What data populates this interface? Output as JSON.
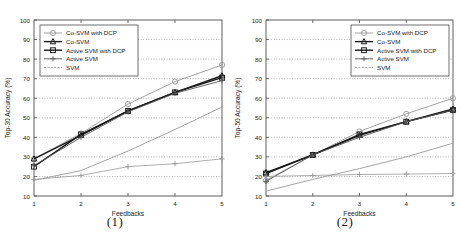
{
  "figure": {
    "panels": [
      {
        "caption": "(1)",
        "xlabel": "Feedbacks",
        "ylabel": "Top-30 Accuracy (%)"
      },
      {
        "caption": "(2)",
        "xlabel": "Feedbacks",
        "ylabel": "Top-50 Accuracy (%)"
      }
    ],
    "legend_labels": [
      "Co-SVM with DCP",
      "Co-SVM",
      "Active SVM with DCP",
      "Active SVM",
      "SVM"
    ],
    "xticks": [
      "1",
      "2",
      "3",
      "4",
      "5"
    ],
    "yticks": [
      "10",
      "20",
      "30",
      "40",
      "50",
      "60",
      "70",
      "80",
      "90",
      "100"
    ],
    "colors": {
      "dark": "#1a1a1a",
      "mid": "#555555",
      "light": "#999999",
      "grid": "#8c8c8c",
      "axis": "#4d4d4d",
      "background": "#ffffff"
    }
  },
  "chart_data": [
    {
      "type": "line",
      "title": "",
      "xlabel": "Feedbacks",
      "ylabel": "Top-30 Accuracy (%)",
      "caption": "(1)",
      "x": [
        1,
        2,
        3,
        4,
        5
      ],
      "xlim": [
        1,
        5
      ],
      "ylim": [
        10,
        100
      ],
      "grid": true,
      "legend_position": "upper-left",
      "series": [
        {
          "name": "Co-SVM with DCP",
          "marker": "circle",
          "values": [
            29,
            42,
            57,
            68.5,
            77
          ]
        },
        {
          "name": "Co-SVM",
          "marker": "triangle",
          "values": [
            29,
            41,
            53.5,
            63,
            71.5
          ]
        },
        {
          "name": "Active SVM with DCP",
          "marker": "square",
          "values": [
            25,
            41.5,
            53.5,
            63,
            70.5
          ]
        },
        {
          "name": "Active SVM",
          "marker": "plus",
          "values": [
            25.5,
            40,
            53,
            62.5,
            69
          ]
        },
        {
          "name": "SVM",
          "marker": "none",
          "values": [
            18,
            23,
            33,
            44,
            55.5
          ]
        },
        {
          "name": "SVM-flat",
          "marker": "plus",
          "values": [
            18.5,
            20.5,
            25,
            26.5,
            29
          ]
        }
      ]
    },
    {
      "type": "line",
      "title": "",
      "xlabel": "Feedbacks",
      "ylabel": "Top-50 Accuracy (%)",
      "caption": "(2)",
      "x": [
        1,
        2,
        3,
        4,
        5
      ],
      "xlim": [
        1,
        5
      ],
      "ylim": [
        10,
        100
      ],
      "grid": true,
      "legend_position": "upper-right",
      "series": [
        {
          "name": "Co-SVM with DCP",
          "marker": "circle",
          "values": [
            18,
            31,
            43,
            52,
            60
          ]
        },
        {
          "name": "Co-SVM",
          "marker": "triangle",
          "values": [
            22,
            31,
            41,
            48,
            54.5
          ]
        },
        {
          "name": "Active SVM with DCP",
          "marker": "square",
          "values": [
            21.5,
            31,
            41.5,
            48,
            54
          ]
        },
        {
          "name": "Active SVM",
          "marker": "plus",
          "values": [
            17.5,
            31,
            40,
            48,
            54
          ]
        },
        {
          "name": "SVM",
          "marker": "none",
          "values": [
            12.5,
            18.5,
            24,
            30,
            37
          ]
        },
        {
          "name": "SVM-flat",
          "marker": "plus",
          "values": [
            20,
            20.5,
            21,
            21.2,
            21.5
          ]
        }
      ]
    }
  ]
}
